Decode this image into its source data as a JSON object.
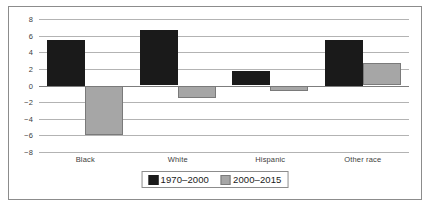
{
  "chart_data": {
    "type": "bar",
    "title": "",
    "xlabel": "",
    "ylabel": "",
    "categories": [
      "Black",
      "White",
      "Hispanic",
      "Other race"
    ],
    "series": [
      {
        "name": "1970–2000",
        "color": "#1a1a1a",
        "values": [
          5.5,
          6.7,
          1.7,
          5.5
        ]
      },
      {
        "name": "2000–2015",
        "color": "#a6a6a6",
        "values": [
          -5.9,
          -1.5,
          -0.7,
          2.7
        ]
      }
    ],
    "ylim": [
      -8,
      8
    ],
    "yticks": [
      8,
      6,
      4,
      2,
      0,
      -2,
      -4,
      -6,
      -8
    ],
    "ytick_labels": [
      "8",
      "6",
      "4",
      "2",
      "0",
      "−2",
      "−4",
      "−6",
      "−8"
    ],
    "grid": true,
    "legend_position": "bottom"
  }
}
